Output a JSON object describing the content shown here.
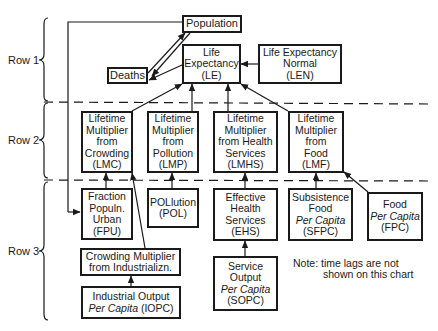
{
  "rows": [
    {
      "label": "Row 1"
    },
    {
      "label": "Row 2"
    },
    {
      "label": "Row 3"
    }
  ],
  "nodes": {
    "population": {
      "lines": [
        "Population"
      ]
    },
    "deaths": {
      "lines": [
        "Deaths"
      ]
    },
    "le": {
      "lines": [
        "Life",
        "Expectancy",
        "(LE)"
      ]
    },
    "len": {
      "lines": [
        "Life Expectancy",
        "Normal",
        "(LEN)"
      ]
    },
    "lmc": {
      "lines": [
        "Lifetime",
        "Multiplier",
        "from",
        "Crowding",
        "(LMC)"
      ]
    },
    "lmp": {
      "lines": [
        "Lifetime",
        "Multiplier",
        "from",
        "Pollution",
        "(LMP)"
      ]
    },
    "lmhs": {
      "lines": [
        "Lifetime",
        "Multiplier",
        "from Health",
        "Services",
        "(LMHS)"
      ]
    },
    "lmf": {
      "lines": [
        "Lifetime",
        "Multiplier",
        "from",
        "Food",
        "(LMF)"
      ]
    },
    "fpu": {
      "lines": [
        "Fraction",
        "Populn.",
        "Urban",
        "(FPU)"
      ]
    },
    "pol": {
      "lines": [
        "POLlution",
        "(POL)"
      ]
    },
    "ehs": {
      "lines": [
        "Effective",
        "Health",
        "Services",
        "(EHS)"
      ]
    },
    "sfpc": {
      "lines": [
        "Subsistence",
        "Food",
        "Per Capita",
        "(SFPC)"
      ]
    },
    "fpc": {
      "lines": [
        "Food",
        "Per Capita",
        "(FPC)"
      ]
    },
    "cmi": {
      "lines": [
        "Crowding Multiplier",
        "from Industrializn."
      ]
    },
    "iopc": {
      "line1": "Industrial Output",
      "line2_italic": "Per Capita",
      "line2_rest": " (IOPC)"
    },
    "sopc": {
      "lines": [
        "Service",
        "Output",
        "Per Capita",
        "(SOPC)"
      ]
    }
  },
  "note": {
    "line1": "Note: time lags are not",
    "line2": "shown on this chart"
  }
}
